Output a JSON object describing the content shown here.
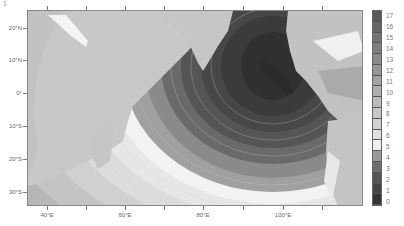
{
  "panel_label": "1",
  "map": {
    "type": "filled-contour",
    "region": "Indian Ocean",
    "y_labels": [
      {
        "text": "20°N",
        "y": 28
      },
      {
        "text": "10°N",
        "y": 60
      },
      {
        "text": "0°",
        "y": 93
      },
      {
        "text": "10°S",
        "y": 126
      },
      {
        "text": "20°S",
        "y": 159
      },
      {
        "text": "30°S",
        "y": 192
      }
    ],
    "x_labels": [
      {
        "text": "40°E",
        "x": 47
      },
      {
        "text": "60°E",
        "x": 125
      },
      {
        "text": "80°E",
        "x": 203
      },
      {
        "text": "100°E",
        "x": 283
      }
    ]
  },
  "colorbar": {
    "min": 0,
    "max": 17,
    "labels": [
      "17",
      "16",
      "15",
      "14",
      "13",
      "12",
      "11",
      "10",
      "9",
      "8",
      "7",
      "6",
      "5",
      "4",
      "3",
      "2",
      "1",
      "0"
    ],
    "colors": [
      "#5a5a5a",
      "#666",
      "#727272",
      "#7e7e7e",
      "#8a8a8a",
      "#969696",
      "#a2a2a2",
      "#aeaeae",
      "#bababa",
      "#c6c6c6",
      "#d2d2d2",
      "#dedede",
      "#f0f0f0",
      "#9a9a9a",
      "#6e6e6e",
      "#555555",
      "#444444",
      "#333333"
    ]
  },
  "chart_data": {
    "type": "heatmap",
    "title": "",
    "xlabel": "Longitude",
    "ylabel": "Latitude",
    "x_ticks": [
      "40°E",
      "60°E",
      "80°E",
      "100°E"
    ],
    "y_ticks": [
      "20°N",
      "10°N",
      "0°",
      "10°S",
      "20°S",
      "30°S"
    ],
    "colorbar_range": [
      0,
      17
    ],
    "colorbar_ticks": [
      0,
      1,
      2,
      3,
      4,
      5,
      6,
      7,
      8,
      9,
      10,
      11,
      12,
      13,
      14,
      15,
      16,
      17
    ]
  }
}
